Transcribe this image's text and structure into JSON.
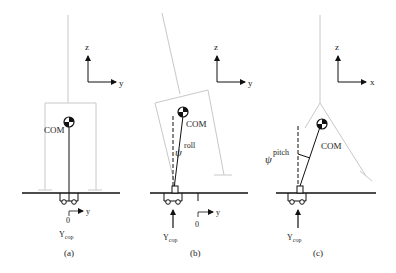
{
  "figure": {
    "panels": [
      {
        "id": "a",
        "caption": "(a)",
        "axes": {
          "vertical": "z",
          "horizontal": "y"
        },
        "labels": {
          "com": "COM",
          "origin": "0",
          "origin_axis": "y",
          "cop_main": "Y",
          "cop_sub": "cop"
        }
      },
      {
        "id": "b",
        "caption": "(b)",
        "axes": {
          "vertical": "z",
          "horizontal": "y"
        },
        "labels": {
          "com": "COM",
          "angle_symbol": "ψ",
          "angle_sup": "roll",
          "origin": "0",
          "origin_axis": "y",
          "cop_main": "Y",
          "cop_sub": "cop"
        }
      },
      {
        "id": "c",
        "caption": "(c)",
        "axes": {
          "vertical": "z",
          "horizontal": "x"
        },
        "labels": {
          "com": "COM",
          "angle_symbol": "ψ",
          "angle_sup": "pitch",
          "cop_main": "Y",
          "cop_sub": "cop"
        }
      }
    ]
  }
}
